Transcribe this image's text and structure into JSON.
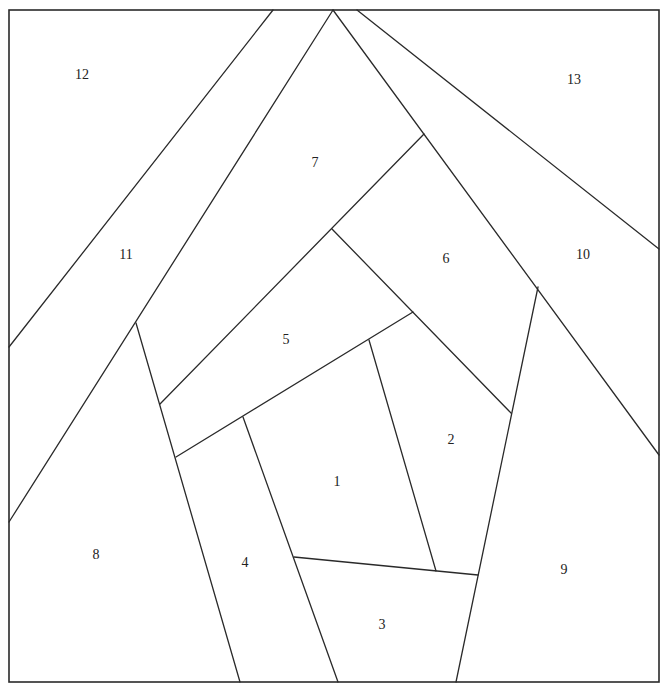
{
  "diagram": {
    "type": "foundation-paper-piecing-pattern",
    "frame": {
      "x1": 9,
      "y1": 10,
      "x2": 659,
      "y2": 682
    },
    "line_color": "#2a2a2a",
    "background": "#ffffff",
    "pieces": [
      {
        "id": "1",
        "label": "1",
        "x": 337,
        "y": 483
      },
      {
        "id": "2",
        "label": "2",
        "x": 451,
        "y": 441
      },
      {
        "id": "3",
        "label": "3",
        "x": 382,
        "y": 626
      },
      {
        "id": "4",
        "label": "4",
        "x": 245,
        "y": 564
      },
      {
        "id": "5",
        "label": "5",
        "x": 286,
        "y": 341
      },
      {
        "id": "6",
        "label": "6",
        "x": 446,
        "y": 260
      },
      {
        "id": "7",
        "label": "7",
        "x": 315,
        "y": 164
      },
      {
        "id": "8",
        "label": "8",
        "x": 96,
        "y": 556
      },
      {
        "id": "9",
        "label": "9",
        "x": 564,
        "y": 571
      },
      {
        "id": "10",
        "label": "10",
        "x": 583,
        "y": 256
      },
      {
        "id": "11",
        "label": "11",
        "x": 126,
        "y": 256
      },
      {
        "id": "12",
        "label": "12",
        "x": 82,
        "y": 76
      },
      {
        "id": "13",
        "label": "13",
        "x": 574,
        "y": 81
      }
    ],
    "seams": [
      {
        "x1": 273,
        "y1": 10,
        "x2": 9,
        "y2": 347
      },
      {
        "x1": 333,
        "y1": 10,
        "x2": 9,
        "y2": 522
      },
      {
        "x1": 333,
        "y1": 10,
        "x2": 659,
        "y2": 455
      },
      {
        "x1": 357,
        "y1": 10,
        "x2": 659,
        "y2": 249
      },
      {
        "x1": 136,
        "y1": 323,
        "x2": 240,
        "y2": 682
      },
      {
        "x1": 424,
        "y1": 134,
        "x2": 160,
        "y2": 404
      },
      {
        "x1": 332,
        "y1": 229,
        "x2": 511,
        "y2": 413
      },
      {
        "x1": 413,
        "y1": 312,
        "x2": 176,
        "y2": 457
      },
      {
        "x1": 538,
        "y1": 287,
        "x2": 456,
        "y2": 682
      },
      {
        "x1": 243,
        "y1": 417,
        "x2": 338,
        "y2": 682
      },
      {
        "x1": 369,
        "y1": 340,
        "x2": 436,
        "y2": 571
      },
      {
        "x1": 294,
        "y1": 557,
        "x2": 478,
        "y2": 575
      }
    ]
  }
}
